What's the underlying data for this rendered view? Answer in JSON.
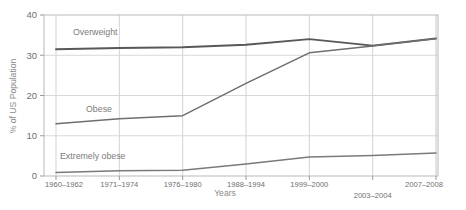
{
  "chart_data": {
    "type": "line",
    "title": "",
    "xlabel": "Years",
    "ylabel": "% of US Population",
    "ylim": [
      0,
      40
    ],
    "yticks": [
      0,
      10,
      20,
      30,
      40
    ],
    "ytick_labels": [
      "0",
      "10",
      "20",
      "30",
      "40"
    ],
    "grid": true,
    "legend_position": "inline-labels",
    "categories": [
      "1960–1962",
      "1971–1974",
      "1976–1980",
      "1988–1994",
      "1999–2000",
      "2003–2004",
      "2007–2008"
    ],
    "category_offset_rows": [
      0,
      0,
      0,
      0,
      0,
      1,
      0
    ],
    "series": [
      {
        "name": "Overweight",
        "color": "#585858",
        "values": [
          31.5,
          31.8,
          32.0,
          32.6,
          34.0,
          32.4,
          34.2
        ]
      },
      {
        "name": "Obese",
        "color": "#6e6e6e",
        "values": [
          13.0,
          14.2,
          15.0,
          23.0,
          30.6,
          32.3,
          34.1
        ]
      },
      {
        "name": "Extremely obese",
        "color": "#7a7a7a",
        "values": [
          0.9,
          1.3,
          1.4,
          3.0,
          4.7,
          5.1,
          5.7
        ]
      }
    ],
    "series_inline_labels": [
      {
        "text": "Overweight",
        "x_px": 73,
        "y_px": 35
      },
      {
        "text": "Obese",
        "x_px": 86,
        "y_px": 112
      },
      {
        "text": "Extremely obese",
        "x_px": 60,
        "y_px": 159
      }
    ]
  },
  "axis": {
    "xlabel": "Years",
    "ylabel": "% of US Population"
  }
}
